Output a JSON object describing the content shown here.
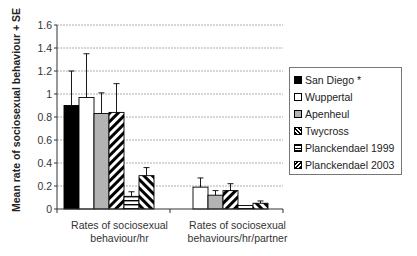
{
  "chart_data": {
    "type": "bar",
    "title": "",
    "xlabel": "",
    "ylabel": "Mean rate of sociosexual behaviour + SE",
    "ylim": [
      0,
      1.6
    ],
    "yticks": [
      "0",
      "0.2",
      "0.4",
      "0.6",
      "0.8",
      "1",
      "1.2",
      "1.4",
      "1.6"
    ],
    "grid": true,
    "legend_position": "right",
    "categories": [
      "Rates of sociosexual behaviour/hr",
      "Rates of sociosexual behaviours/hr/partner"
    ],
    "category_lines": [
      [
        "Rates of sociosexual",
        "behaviour/hr"
      ],
      [
        "Rates of sociosexual",
        "behaviours/hr/partner"
      ]
    ],
    "series": [
      {
        "name": "San Diego *",
        "values": [
          0.9,
          0
        ],
        "error_top": [
          1.2,
          0
        ],
        "fill": "black"
      },
      {
        "name": "Wuppertal",
        "values": [
          0.97,
          0.19
        ],
        "error_top": [
          1.35,
          0.27
        ],
        "fill": "white"
      },
      {
        "name": "Apenheul",
        "values": [
          0.83,
          0.12
        ],
        "error_top": [
          1.01,
          0.16
        ],
        "fill": "gray"
      },
      {
        "name": "Twycross",
        "values": [
          0.84,
          0.16
        ],
        "error_top": [
          1.09,
          0.22
        ],
        "fill": "diagonal-up"
      },
      {
        "name": "Planckendael 1999",
        "values": [
          0.11,
          0.03
        ],
        "error_top": [
          0.15,
          0.03
        ],
        "fill": "horizontal"
      },
      {
        "name": "Planckendael 2003",
        "values": [
          0.29,
          0.05
        ],
        "error_top": [
          0.36,
          0.07
        ],
        "fill": "diagonal-down"
      }
    ]
  }
}
